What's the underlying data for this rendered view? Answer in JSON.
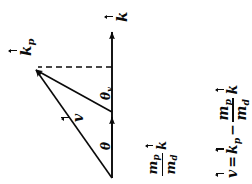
{
  "figure": {
    "background_color": "#ffffff",
    "stroke_color": "#0a0a0a"
  },
  "symbols": {
    "k": "k",
    "k_p": "k",
    "k_p_sub": "p",
    "v": "v",
    "theta": "θ",
    "theta_v": "θ",
    "theta_v_sub": "v",
    "m": "m",
    "m_p_sub": "p",
    "m_d_sub": "d",
    "equals": "=",
    "minus": "−"
  },
  "labels": {
    "k_vector": "k",
    "kp_vector": "k_p",
    "v_vector": "v",
    "theta": "θ",
    "theta_v": "θ_v",
    "mpmd_k": "(m_p/m_d) k"
  },
  "equation": {
    "text": "v = k_p − (m_p/m_d) k",
    "lhs": "v",
    "operator_equals": "=",
    "term1": "k_p",
    "operator_minus": "−",
    "term2_numerator": "m_p",
    "term2_denominator": "m_d",
    "term2_factor": "k"
  },
  "geometry": {
    "axis_origin": [
      112,
      178
    ],
    "axis_tip": [
      112,
      27
    ],
    "mid_arrow_tip": [
      112,
      112
    ],
    "kp_tip": [
      31,
      68
    ],
    "dashed_line_from": [
      112,
      67
    ],
    "dashed_line_to": [
      36,
      67
    ],
    "dash_pattern": "6,4"
  }
}
